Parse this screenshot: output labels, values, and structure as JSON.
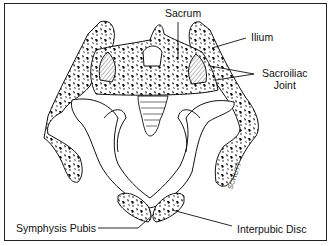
{
  "figure": {
    "type": "anatomical illustration",
    "border_color": "#222222",
    "ink_color": "#111111"
  },
  "labels": {
    "sacrum": "Sacrum",
    "ilium": "Ilium",
    "sacroiliac_line1": "Sacroiliac",
    "sacroiliac_line2": "Joint",
    "symphysis_pubis": "Symphysis Pubis",
    "interpubic_disc": "Interpubic Disc"
  },
  "signature": "SCHUTT"
}
